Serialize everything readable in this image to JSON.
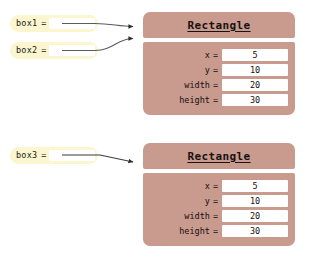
{
  "diagram": {
    "colors": {
      "variable_box_fill": "#fbf6cf",
      "variable_slot_fill": "#ffffff",
      "object_fill": "#c99a8e",
      "field_value_fill": "#ffffff",
      "arrow_color": "#3a3a3a",
      "text_color": "#15100e",
      "background": "#ffffff"
    },
    "variables": [
      {
        "name": "box1",
        "equals": "=",
        "value": "",
        "points_to": "rectangle-1"
      },
      {
        "name": "box2",
        "equals": "=",
        "value": "",
        "points_to": "rectangle-1"
      },
      {
        "name": "box3",
        "equals": "=",
        "value": "",
        "points_to": "rectangle-2"
      }
    ],
    "objects": [
      {
        "id": "rectangle-1",
        "type_name": "Rectangle",
        "fields": [
          {
            "label": "x",
            "equals": "=",
            "value": "5"
          },
          {
            "label": "y",
            "equals": "=",
            "value": "10"
          },
          {
            "label": "width",
            "equals": "=",
            "value": "20"
          },
          {
            "label": "height",
            "equals": "=",
            "value": "30"
          }
        ]
      },
      {
        "id": "rectangle-2",
        "type_name": "Rectangle",
        "fields": [
          {
            "label": "x",
            "equals": "=",
            "value": "5"
          },
          {
            "label": "y",
            "equals": "=",
            "value": "10"
          },
          {
            "label": "width",
            "equals": "=",
            "value": "20"
          },
          {
            "label": "height",
            "equals": "=",
            "value": "30"
          }
        ]
      }
    ]
  }
}
